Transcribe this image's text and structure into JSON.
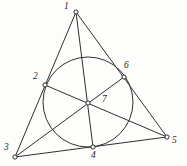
{
  "figure": {
    "background_color": "#fdfdfb",
    "stroke_color": "#2f2f2f",
    "node_fill_color": "#fdfdfb",
    "width": 187,
    "height": 166
  },
  "points": [
    {
      "id": "1",
      "label": "1",
      "x": 76,
      "y": 12,
      "label_x": 64,
      "label_y": 2,
      "role": "triangle-vertex-top"
    },
    {
      "id": "2",
      "label": "2",
      "x": 45,
      "y": 85,
      "label_x": 33,
      "label_y": 72,
      "role": "tangent-point-left-side"
    },
    {
      "id": "3",
      "label": "3",
      "x": 15,
      "y": 157,
      "label_x": 4,
      "label_y": 143,
      "role": "triangle-vertex-bottom-left"
    },
    {
      "id": "4",
      "label": "4",
      "x": 93,
      "y": 147,
      "label_x": 91,
      "label_y": 151,
      "role": "tangent-point-bottom-side"
    },
    {
      "id": "5",
      "label": "5",
      "x": 167,
      "y": 137,
      "label_x": 172,
      "label_y": 136,
      "role": "triangle-vertex-bottom-right"
    },
    {
      "id": "6",
      "label": "6",
      "x": 124,
      "y": 77,
      "label_x": 124,
      "label_y": 61,
      "role": "tangent-point-right-side"
    },
    {
      "id": "7",
      "label": "7",
      "x": 88,
      "y": 103,
      "label_x": 102,
      "label_y": 95,
      "role": "incenter-concurrency-point"
    }
  ],
  "circle": {
    "cx": 88,
    "cy": 102,
    "r": 45,
    "name": "inscribed-circle"
  },
  "segments": [
    {
      "name": "side-1-3",
      "from": "1",
      "to": "3"
    },
    {
      "name": "side-1-5",
      "from": "1",
      "to": "5"
    },
    {
      "name": "side-3-5",
      "from": "3",
      "to": "5"
    },
    {
      "name": "cevian-1-4",
      "from": "1",
      "to": "4"
    },
    {
      "name": "cevian-2-5",
      "from": "2",
      "to": "5"
    },
    {
      "name": "cevian-3-6",
      "from": "3",
      "to": "6"
    }
  ]
}
